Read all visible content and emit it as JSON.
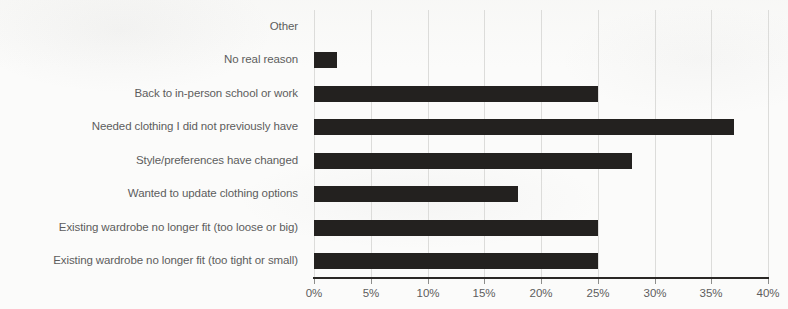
{
  "chart_data": {
    "type": "bar",
    "orientation": "horizontal",
    "title": "",
    "subtitle": "",
    "xlabel": "",
    "ylabel": "",
    "xlim": [
      0,
      40
    ],
    "xunit": "%",
    "grid": true,
    "legend": false,
    "legend_position": "none",
    "bar_color": "#23211f",
    "gridline_color": "#dcdcda",
    "axis_color": "#2a2825",
    "label_color": "#5d5d5d",
    "background_color": "#fbfbfa",
    "xticks": [
      {
        "value": 0,
        "label": "0%"
      },
      {
        "value": 5,
        "label": "5%"
      },
      {
        "value": 10,
        "label": "10%"
      },
      {
        "value": 15,
        "label": "15%"
      },
      {
        "value": 20,
        "label": "20%"
      },
      {
        "value": 25,
        "label": "25%"
      },
      {
        "value": 30,
        "label": "30%"
      },
      {
        "value": 35,
        "label": "35%"
      },
      {
        "value": 40,
        "label": "40%"
      }
    ],
    "categories": [
      "Other",
      "No real reason",
      "Back to in-person school or work",
      "Needed clothing I did not previously have",
      "Style/preferences have changed",
      "Wanted to update clothing options",
      "Existing wardrobe no longer fit (too loose or big)",
      "Existing wardrobe no longer fit (too tight or small)"
    ],
    "values": [
      0,
      2,
      25,
      37,
      28,
      18,
      25,
      25
    ],
    "bars": [
      {
        "category": "Other",
        "value": 0
      },
      {
        "category": "No real reason",
        "value": 2
      },
      {
        "category": "Back to in-person school or work",
        "value": 25
      },
      {
        "category": "Needed clothing I did not previously have",
        "value": 37
      },
      {
        "category": "Style/preferences have changed",
        "value": 28
      },
      {
        "category": "Wanted to update clothing options",
        "value": 18
      },
      {
        "category": "Existing wardrobe no longer fit (too loose or big)",
        "value": 25
      },
      {
        "category": "Existing wardrobe no longer fit (too tight or small)",
        "value": 25
      }
    ]
  }
}
